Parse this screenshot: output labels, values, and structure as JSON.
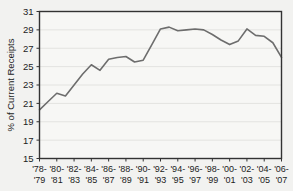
{
  "chart_data": {
    "type": "line",
    "title": "",
    "xlabel": "",
    "ylabel": "% of Current Receipts",
    "ylim": [
      15,
      31
    ],
    "yticks": [
      15,
      17,
      19,
      21,
      23,
      25,
      27,
      29,
      31
    ],
    "grid": true,
    "legend": "none",
    "line_color": "#6d6d6d",
    "plot_background": "#f7f7f5",
    "page_background": "#f2f2f0",
    "axis_color": "#333333",
    "categories": [
      "'78-'79",
      "'79-'80",
      "'80-'81",
      "'81-'82",
      "'82-'83",
      "'83-'84",
      "'84-'85",
      "'85-'86",
      "'86-'87",
      "'87-'88",
      "'88-'89",
      "'89-'90",
      "'90-'91",
      "'91-'92",
      "'92-'93",
      "'93-'94",
      "'94-'95",
      "'95-'96",
      "'96-'97",
      "'97-'98",
      "'98-'99",
      "'99-'00",
      "'00-'01",
      "'01-'02",
      "'02-'03",
      "'03-'04",
      "'04-'05",
      "'05-'06",
      "'06-'07"
    ],
    "xtick_labels": [
      {
        "top": "'78-",
        "bottom": "'79"
      },
      {
        "top": "'80-",
        "bottom": "'81"
      },
      {
        "top": "'82-",
        "bottom": "'83"
      },
      {
        "top": "'84-",
        "bottom": "'85"
      },
      {
        "top": "'86-",
        "bottom": "'87"
      },
      {
        "top": "'88-",
        "bottom": "'89"
      },
      {
        "top": "'90-",
        "bottom": "'91"
      },
      {
        "top": "'92-",
        "bottom": "'93"
      },
      {
        "top": "'94-",
        "bottom": "'95"
      },
      {
        "top": "'96-",
        "bottom": "'97"
      },
      {
        "top": "'98-",
        "bottom": "'99"
      },
      {
        "top": "'00-",
        "bottom": "'01"
      },
      {
        "top": "'02-",
        "bottom": "'03"
      },
      {
        "top": "'04-",
        "bottom": "'05"
      },
      {
        "top": "'06-",
        "bottom": "'07"
      }
    ],
    "values": [
      20.3,
      21.2,
      22.1,
      21.8,
      23.0,
      24.2,
      25.2,
      24.6,
      25.8,
      26.0,
      26.1,
      25.5,
      25.7,
      27.4,
      29.1,
      29.3,
      28.9,
      29.0,
      29.1,
      29.0,
      28.5,
      27.9,
      27.4,
      27.8,
      29.1,
      28.4,
      28.3,
      27.6,
      26.0
    ]
  }
}
